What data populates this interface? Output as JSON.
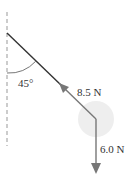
{
  "diagram": {
    "angle_label": "45°",
    "tension_label": "8.5 N",
    "weight_label": "6.0 N",
    "colors": {
      "rope": "#333333",
      "arrow": "#777777",
      "dashed": "#999999",
      "ball": "#eeeeee"
    }
  }
}
